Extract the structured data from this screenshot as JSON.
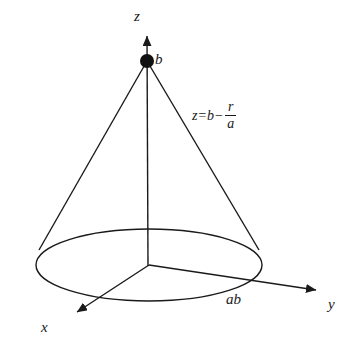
{
  "figure": {
    "background_color": "#ffffff",
    "stroke_color": "#1a1a1a"
  },
  "axes": {
    "z": {
      "label": "z",
      "name": "z-axis"
    },
    "y": {
      "label": "y",
      "name": "y-axis"
    },
    "x": {
      "label": "x",
      "name": "x-axis"
    }
  },
  "annotations": {
    "apex_label": "b",
    "base_radius_label": "ab",
    "equation": {
      "lhs": "z=b−",
      "numerator": "r",
      "denominator": "a",
      "full_text": "z=b−r/a"
    }
  },
  "geometry": {
    "origin": {
      "x": 149,
      "y": 265
    },
    "apex": {
      "x": 147,
      "y": 61
    },
    "base_ellipse": {
      "cx": 149,
      "cy": 265,
      "rx": 113,
      "ry": 36
    },
    "z_axis_tip": {
      "x": 147,
      "y": 32
    },
    "y_axis_tip": {
      "x": 322,
      "y": 292
    },
    "x_axis_tip": {
      "x": 70,
      "y": 315
    },
    "slant_left_contact": {
      "x": 40,
      "y": 249
    },
    "slant_right_contact": {
      "x": 258,
      "y": 249
    },
    "apex_dot_radius": 7
  }
}
